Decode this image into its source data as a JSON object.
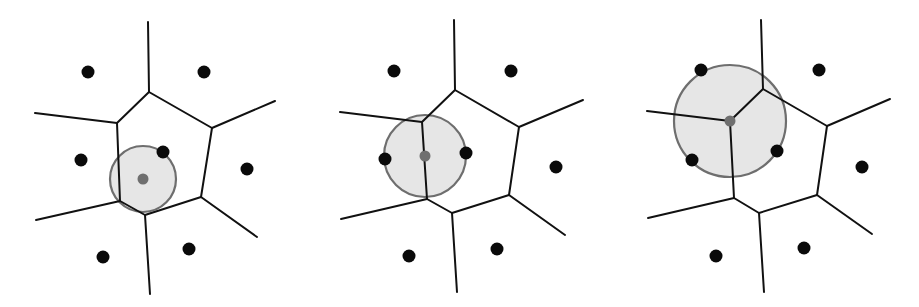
{
  "diagram": {
    "title": "",
    "colors": {
      "background": "#ffffff",
      "edge": "#111111",
      "site": "#0a0a0a",
      "circle_fill": "#e6e6e6",
      "circle_stroke": "#6e6e6e",
      "center": "#6f6f6f"
    },
    "edge_width": 2,
    "site_radius": 6.5,
    "center_radius": 5.5,
    "panels": [
      {
        "id": "panel-inside-cell",
        "label": "",
        "circle": {
          "cx": 143,
          "cy": 179,
          "r": 33
        },
        "center": {
          "x": 143,
          "y": 179
        },
        "sites": [
          {
            "x": 88,
            "y": 72
          },
          {
            "x": 204,
            "y": 72
          },
          {
            "x": 81,
            "y": 160
          },
          {
            "x": 247,
            "y": 169
          },
          {
            "x": 103,
            "y": 257
          },
          {
            "x": 189,
            "y": 249
          },
          {
            "x": 163,
            "y": 152
          }
        ],
        "edges": [
          [
            149,
            92,
            212,
            128
          ],
          [
            212,
            128,
            201,
            197
          ],
          [
            201,
            197,
            145,
            215
          ],
          [
            145,
            215,
            120,
            201
          ],
          [
            120,
            201,
            117,
            123
          ],
          [
            117,
            123,
            149,
            92
          ],
          [
            149,
            92,
            148,
            22
          ],
          [
            117,
            123,
            35,
            113
          ],
          [
            212,
            128,
            275,
            101
          ],
          [
            201,
            197,
            257,
            237
          ],
          [
            145,
            215,
            150,
            294
          ],
          [
            120,
            201,
            36,
            220
          ]
        ]
      },
      {
        "id": "panel-on-edge",
        "label": "",
        "circle": {
          "cx": 425,
          "cy": 156,
          "r": 41
        },
        "center": {
          "x": 425,
          "y": 156
        },
        "sites": [
          {
            "x": 394,
            "y": 71
          },
          {
            "x": 511,
            "y": 71
          },
          {
            "x": 385,
            "y": 159
          },
          {
            "x": 556,
            "y": 167
          },
          {
            "x": 409,
            "y": 256
          },
          {
            "x": 497,
            "y": 249
          },
          {
            "x": 466,
            "y": 153
          }
        ],
        "edges": [
          [
            455,
            90,
            519,
            127
          ],
          [
            519,
            127,
            509,
            195
          ],
          [
            509,
            195,
            452,
            213
          ],
          [
            452,
            213,
            427,
            199
          ],
          [
            427,
            199,
            422,
            122
          ],
          [
            422,
            122,
            455,
            90
          ],
          [
            455,
            90,
            454,
            20
          ],
          [
            422,
            122,
            340,
            112
          ],
          [
            519,
            127,
            583,
            100
          ],
          [
            509,
            195,
            565,
            235
          ],
          [
            452,
            213,
            457,
            292
          ],
          [
            427,
            199,
            341,
            219
          ]
        ]
      },
      {
        "id": "panel-at-vertex",
        "label": "",
        "circle": {
          "cx": 730,
          "cy": 121,
          "r": 56
        },
        "center": {
          "x": 730,
          "y": 121
        },
        "sites": [
          {
            "x": 701,
            "y": 70
          },
          {
            "x": 819,
            "y": 70
          },
          {
            "x": 692,
            "y": 160
          },
          {
            "x": 862,
            "y": 167
          },
          {
            "x": 716,
            "y": 256
          },
          {
            "x": 804,
            "y": 248
          },
          {
            "x": 777,
            "y": 151
          }
        ],
        "edges": [
          [
            763,
            89,
            827,
            126
          ],
          [
            827,
            126,
            817,
            195
          ],
          [
            817,
            195,
            759,
            213
          ],
          [
            759,
            213,
            734,
            198
          ],
          [
            734,
            198,
            730,
            121
          ],
          [
            730,
            121,
            763,
            89
          ],
          [
            763,
            89,
            761,
            20
          ],
          [
            730,
            121,
            647,
            111
          ],
          [
            827,
            126,
            890,
            99
          ],
          [
            817,
            195,
            872,
            234
          ],
          [
            759,
            213,
            764,
            292
          ],
          [
            734,
            198,
            648,
            218
          ]
        ]
      }
    ]
  }
}
